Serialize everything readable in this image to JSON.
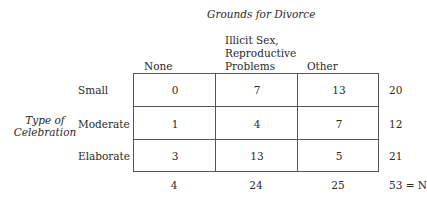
{
  "title": "Grounds for Divorce",
  "row_variable": [
    "Type of",
    "Celebration"
  ],
  "columns": [
    {
      "label_lines": [
        "None"
      ]
    },
    {
      "label_lines": [
        "Illicit Sex,",
        "Reproductive",
        "Problems"
      ]
    },
    {
      "label_lines": [
        "Other"
      ]
    }
  ],
  "rows": [
    {
      "label": "Small",
      "values": [
        "0",
        "7",
        "13"
      ],
      "total": "20"
    },
    {
      "label": "Moderate",
      "values": [
        "1",
        "4",
        "7"
      ],
      "total": "12"
    },
    {
      "label": "Elaborate",
      "values": [
        "3",
        "13",
        "5"
      ],
      "total": "21"
    }
  ],
  "column_totals": [
    "4",
    "24",
    "25"
  ],
  "grand_total": "53 = N"
}
